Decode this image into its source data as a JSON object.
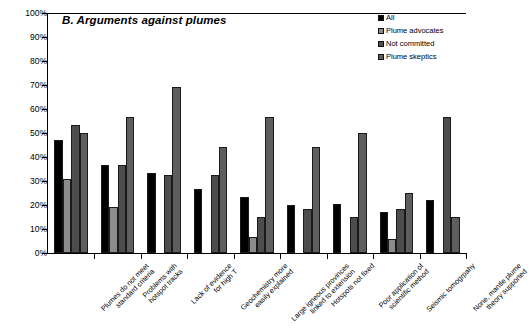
{
  "chart_data": {
    "type": "bar",
    "title": "B. Arguments against plumes",
    "xlabel": "",
    "ylabel": "",
    "ylim": [
      0,
      100
    ],
    "ytick_labels": [
      "0%",
      "10%",
      "20%",
      "30%",
      "40%",
      "50%",
      "60%",
      "70%",
      "80%",
      "90%",
      "100%"
    ],
    "ytick_values": [
      0,
      10,
      20,
      30,
      40,
      50,
      60,
      70,
      80,
      90,
      100
    ],
    "grid": false,
    "legend_position": "top-right",
    "categories": [
      "Plumes do not meet standard criteria",
      "Problems with hotspot tracks",
      "Lack of evidence for high T",
      "Geochemistry more easily explained",
      "Large igneous provinces linked to extension",
      "Hotspots not fixed",
      "Poor application of scientific method",
      "Seismic tomogrpahy",
      "None, mantle plume theory supported"
    ],
    "category_lines": [
      [
        "Plumes do not meet",
        "standard criteria"
      ],
      [
        "Problems with",
        "hotspot tracks"
      ],
      [
        "Lack of evidence",
        "for high T"
      ],
      [
        "Geochemistry more",
        "easily explained"
      ],
      [
        "Large igneous provinces",
        "linked to extension"
      ],
      [
        "Hotspots not fixed"
      ],
      [
        "Poor application of",
        "scientific method"
      ],
      [
        "Seismic tomogrpahy"
      ],
      [
        "None, mantle plume",
        "theory supported"
      ]
    ],
    "series": [
      {
        "name": "All",
        "color": "#000000",
        "values": [
          47,
          36.5,
          33.5,
          26.5,
          23.5,
          20,
          20.5,
          17,
          22
        ]
      },
      {
        "name": "Plume advocates",
        "color": "#8c8c8c",
        "values": [
          31,
          19,
          0,
          0,
          6.5,
          0,
          0,
          6,
          0
        ]
      },
      {
        "name": "Not committed",
        "color": "#4d4d4d",
        "values": [
          53.5,
          36.5,
          32.5,
          32.5,
          15,
          18.5,
          15,
          18.5,
          56.5
        ]
      },
      {
        "name": "Plume skeptics",
        "color": "#5e5e5e",
        "values": [
          50,
          56.5,
          69,
          44,
          56.5,
          44,
          50,
          25,
          15
        ]
      }
    ]
  },
  "legend": {
    "items": [
      {
        "label": "All",
        "color": "#000000"
      },
      {
        "label": "Plume advocates",
        "color": "#8c8c8c"
      },
      {
        "label": "Not committed",
        "color": "#4d4d4d"
      },
      {
        "label": "Plume skeptics",
        "color": "#5e5e5e"
      }
    ]
  }
}
